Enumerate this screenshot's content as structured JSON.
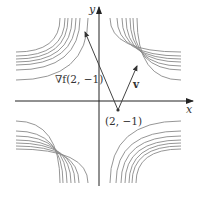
{
  "diagram": {
    "type": "level-curves-with-vectors",
    "origin_px": [
      99,
      101
    ],
    "axes": {
      "x_label": "x",
      "y_label": "y",
      "color": "#333333"
    },
    "contour_color": "#8a8a8a",
    "vector_color": "#444444",
    "point": {
      "label": "(2, −1)",
      "px": [
        118,
        110
      ]
    },
    "gradient_vector": {
      "label": "∇f(2, −1)",
      "tip_px": [
        85,
        32
      ]
    },
    "direction_vector": {
      "label": "v",
      "tip_px": [
        137,
        66
      ]
    },
    "contours": {
      "upper_left": {
        "left_end_y": [
          52,
          56,
          59,
          62,
          65,
          70,
          80
        ],
        "top_end_x": [
          60,
          65,
          68,
          72,
          76,
          80,
          88
        ]
      },
      "upper_right": {
        "right_end_y": [
          52,
          56,
          59,
          62,
          66,
          70,
          80
        ],
        "top_end_x": [
          137,
          133,
          130,
          126,
          122,
          117,
          110
        ]
      },
      "lower_left": {
        "left_end_y": [
          149,
          146,
          143,
          140,
          136,
          131,
          121
        ],
        "bottom_end_x": [
          60,
          63,
          67,
          71,
          75,
          79,
          88
        ]
      },
      "lower_right": {
        "right_end_y": [
          149,
          146,
          143,
          140,
          136,
          131,
          121
        ],
        "bottom_end_x": [
          136,
          132,
          129,
          125,
          121,
          116,
          110
        ]
      }
    }
  }
}
